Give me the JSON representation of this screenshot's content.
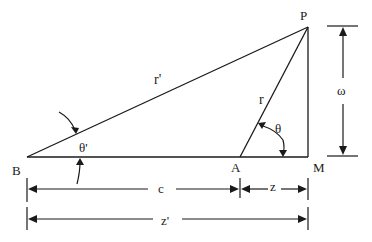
{
  "diagram": {
    "type": "geometry-triangle",
    "points": {
      "P": {
        "label": "P",
        "x": 308,
        "y": 27
      },
      "B": {
        "label": "B",
        "x": 27,
        "y": 157
      },
      "A": {
        "label": "A",
        "x": 240,
        "y": 157
      },
      "M": {
        "label": "M",
        "x": 308,
        "y": 157
      }
    },
    "segments": {
      "BP": {
        "label": "r'"
      },
      "AP": {
        "label": "r"
      },
      "BM": {
        "label": ""
      },
      "PM": {
        "label": ""
      }
    },
    "angles": {
      "at_B": {
        "label": "θ'"
      },
      "at_A": {
        "label": "θ"
      }
    },
    "dimensions": {
      "height": {
        "label": "ω"
      },
      "c": {
        "label": "c"
      },
      "z": {
        "label": "z"
      },
      "z_prime": {
        "label": "z'"
      }
    },
    "colors": {
      "ink": "#1a1a1a",
      "background": "#ffffff"
    }
  }
}
